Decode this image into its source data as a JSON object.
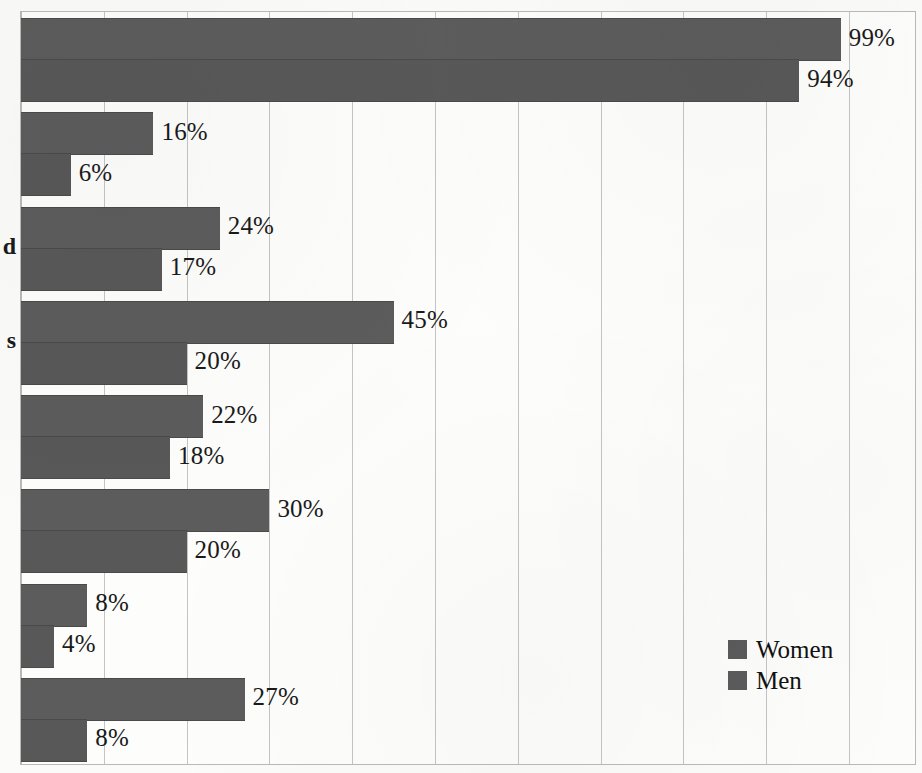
{
  "chart_data": {
    "type": "bar",
    "orientation": "horizontal",
    "title": "",
    "subtitle": "",
    "xlabel": "",
    "ylabel": "",
    "xlim": [
      0,
      110
    ],
    "xtick_labels": [],
    "grid": true,
    "grid_axis": "x",
    "grid_interval": 10,
    "legend_position": "bottom-right",
    "value_label_suffix": "%",
    "categories": [
      "",
      "",
      "",
      "",
      "",
      "",
      "",
      ""
    ],
    "category_label_fragments": [
      {
        "text": "d",
        "group_index": 2
      },
      {
        "text": "s",
        "group_index": 3
      }
    ],
    "series": [
      {
        "name": "Women",
        "color": "#5c5c5c",
        "values": [
          99,
          16,
          24,
          45,
          22,
          30,
          8,
          27
        ],
        "value_labels": [
          "99%",
          "16%",
          "24%",
          "45%",
          "22%",
          "30%",
          "8%",
          "27%"
        ]
      },
      {
        "name": "Men",
        "color": "#585858",
        "values": [
          94,
          6,
          17,
          20,
          18,
          20,
          4,
          8
        ],
        "value_labels": [
          "94%",
          "6%",
          "17%",
          "20%",
          "18%",
          "20%",
          "4%",
          "8%"
        ]
      }
    ]
  },
  "legend": {
    "items": [
      {
        "label": "Women",
        "color": "#5b5b5b"
      },
      {
        "label": "Men",
        "color": "#5b5b5b"
      }
    ]
  },
  "style": {
    "bar_color": "#5b5b5b",
    "grid_color": "#c4c4c4",
    "frame_color": "#b9b9b9",
    "page_background": "#fbfbf9",
    "plot_background": "#fdfdfc",
    "text_color": "#1a1a1a"
  }
}
